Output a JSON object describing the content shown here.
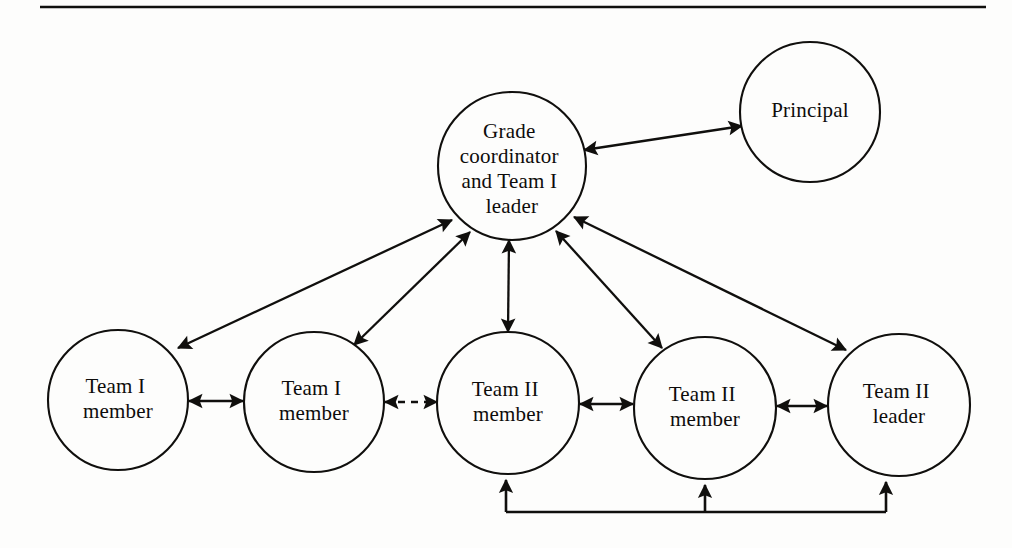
{
  "page": {
    "background_color": "#fdfdfc",
    "ink_color": "#100f0d",
    "width": 1012,
    "height": 548
  },
  "top_rule": {
    "name": "horizontal-rule",
    "x1": 40,
    "x2": 986,
    "y": 7
  },
  "nodes": [
    {
      "id": "grade-coordinator",
      "label_lines": [
        "Grade",
        "coordinator",
        "and Team I",
        "leader"
      ],
      "cx": 512,
      "cy": 166,
      "r": 74
    },
    {
      "id": "principal",
      "label_lines": [
        "Principal"
      ],
      "cx": 810,
      "cy": 112,
      "r": 70
    },
    {
      "id": "team-i-member-1",
      "label_lines": [
        "Team I",
        "member"
      ],
      "cx": 118,
      "cy": 400,
      "r": 70
    },
    {
      "id": "team-i-member-2",
      "label_lines": [
        "Team I",
        "member"
      ],
      "cx": 314,
      "cy": 402,
      "r": 70
    },
    {
      "id": "team-ii-member-1",
      "label_lines": [
        "Team II",
        "member"
      ],
      "cx": 508,
      "cy": 403,
      "r": 71
    },
    {
      "id": "team-ii-member-2",
      "label_lines": [
        "Team II",
        "member"
      ],
      "cx": 705,
      "cy": 408,
      "r": 71
    },
    {
      "id": "team-ii-leader",
      "label_lines": [
        "Team II",
        "leader"
      ],
      "cx": 899,
      "cy": 405,
      "r": 71
    }
  ],
  "edges": [
    {
      "id": "edge-coordinator-principal",
      "from": "grade-coordinator",
      "to": "principal",
      "style": "solid",
      "arrows": "both"
    },
    {
      "id": "edge-coordinator-team-i-member-1",
      "from": "grade-coordinator",
      "to": "team-i-member-1",
      "style": "solid",
      "arrows": "both"
    },
    {
      "id": "edge-coordinator-team-i-member-2",
      "from": "grade-coordinator",
      "to": "team-i-member-2",
      "style": "solid",
      "arrows": "both"
    },
    {
      "id": "edge-coordinator-team-ii-member-1",
      "from": "grade-coordinator",
      "to": "team-ii-member-1",
      "style": "solid",
      "arrows": "both"
    },
    {
      "id": "edge-coordinator-team-ii-member-2",
      "from": "grade-coordinator",
      "to": "team-ii-member-2",
      "style": "solid",
      "arrows": "both"
    },
    {
      "id": "edge-coordinator-team-ii-leader",
      "from": "grade-coordinator",
      "to": "team-ii-leader",
      "style": "solid",
      "arrows": "both"
    },
    {
      "id": "edge-team-i-member-1-team-i-member-2",
      "from": "team-i-member-1",
      "to": "team-i-member-2",
      "style": "solid",
      "arrows": "both"
    },
    {
      "id": "edge-team-i-member-2-team-ii-member-1",
      "from": "team-i-member-2",
      "to": "team-ii-member-1",
      "style": "dashed",
      "arrows": "both"
    },
    {
      "id": "edge-team-ii-member-1-team-ii-member-2",
      "from": "team-ii-member-1",
      "to": "team-ii-member-2",
      "style": "solid",
      "arrows": "both"
    },
    {
      "id": "edge-team-ii-member-2-team-ii-leader",
      "from": "team-ii-member-2",
      "to": "team-ii-leader",
      "style": "solid",
      "arrows": "both"
    }
  ],
  "bottom_bracket": {
    "id": "team-ii-bottom-bracket",
    "style": "solid",
    "arrows": "up-to-each-node",
    "connects": [
      "team-ii-member-1",
      "team-ii-member-2",
      "team-ii-leader"
    ],
    "bus_y": 512,
    "stems_x": [
      506,
      705,
      886
    ],
    "tips_y": [
      478,
      483,
      480
    ]
  }
}
